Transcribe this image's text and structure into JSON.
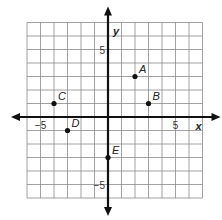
{
  "chart_data": {
    "type": "scatter",
    "title": "",
    "xlabel": "x",
    "ylabel": "y",
    "xlim": [
      -6,
      7
    ],
    "ylim": [
      -6,
      7
    ],
    "grid": true,
    "tick_labels": {
      "x": [
        {
          "value": -5,
          "label": "−5"
        },
        {
          "value": 5,
          "label": "5"
        }
      ],
      "y": [
        {
          "value": 5,
          "label": "5"
        },
        {
          "value": -5,
          "label": "−5"
        }
      ]
    },
    "points": [
      {
        "label": "A",
        "x": 2,
        "y": 3
      },
      {
        "label": "B",
        "x": 3,
        "y": 1
      },
      {
        "label": "C",
        "x": -4,
        "y": 1
      },
      {
        "label": "D",
        "x": -3,
        "y": -1
      },
      {
        "label": "E",
        "x": 0,
        "y": -3
      }
    ]
  }
}
